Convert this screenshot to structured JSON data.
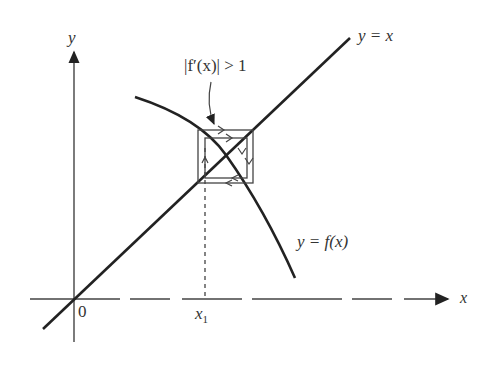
{
  "diagram": {
    "type": "cobweb-fixed-point-iteration",
    "axes": {
      "x_label": "x",
      "y_label": "y",
      "origin_label": "0",
      "x_tick_label": "x",
      "x_tick_subscript": "1"
    },
    "labels": {
      "identity_line": "y = x",
      "function_curve": "y = f(x)",
      "annotation": "|f′(x)| > 1"
    },
    "colors": {
      "ink": "#222222",
      "background": "#ffffff"
    }
  }
}
